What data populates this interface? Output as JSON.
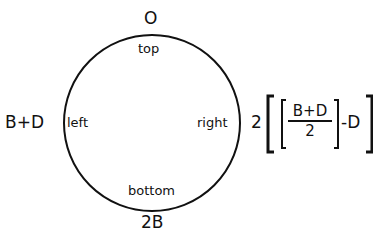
{
  "diagram": {
    "shape": "circle",
    "inner_labels": {
      "top": "top",
      "left": "left",
      "right": "right",
      "bottom": "bottom"
    },
    "outer_values": {
      "top": "O",
      "left": "B+D",
      "bottom": "2B",
      "right": {
        "coefficient": "2",
        "fraction_numerator": "B+D",
        "fraction_denominator": "2",
        "suffix": "-D"
      }
    },
    "colors": {
      "stroke": "#111111",
      "background": "#ffffff"
    }
  }
}
